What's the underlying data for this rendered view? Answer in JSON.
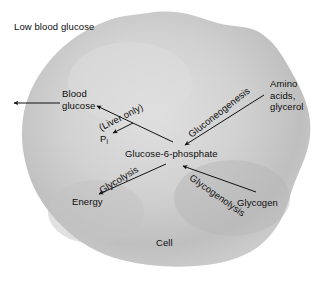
{
  "diagram": {
    "title": "Low blood glucose",
    "cell_label": "Cell",
    "colors": {
      "background": "#ffffff",
      "cell_fill_light": "#e8e8e8",
      "cell_fill_mid": "#c9c9c9",
      "cell_fill_dark": "#b0b0b0",
      "cell_edge": "#d8d8d8",
      "text": "#0d0d0d",
      "arrow": "#111111"
    },
    "labels": {
      "low_blood_glucose": "Low blood glucose",
      "blood_glucose_line1": "Blood",
      "blood_glucose_line2": "glucose",
      "liver_only": "(Liver only)",
      "pi_symbol": "P",
      "pi_subscript": "i",
      "glucose_6_phosphate": "Glucose-6-phosphate",
      "gluconeogenesis": "Gluconeogenesis",
      "amino_acids_line1": "Amino",
      "amino_acids_line2": "acids,",
      "amino_acids_line3": "glycerol",
      "glycolysis": "Glycolysis",
      "energy": "Energy",
      "glycogenolysis": "Glycogenolysis",
      "glycogen": "Glycogen",
      "cell": "Cell"
    },
    "pathways": [
      {
        "name": "gluconeogenesis",
        "label": "Gluconeogenesis",
        "from": "Amino acids, glycerol",
        "to": "Glucose-6-phosphate",
        "direction": "down-left"
      },
      {
        "name": "glycogenolysis",
        "label": "Glycogenolysis",
        "from": "Glycogen",
        "to": "Glucose-6-phosphate",
        "direction": "up-left"
      },
      {
        "name": "glycolysis",
        "label": "Glycolysis",
        "from": "Glucose-6-phosphate",
        "to": "Energy",
        "direction": "down-left"
      },
      {
        "name": "dephosphorylation",
        "label": "(Liver only)",
        "from": "Glucose-6-phosphate",
        "to": "Blood glucose",
        "direction": "up-left",
        "byproduct": "Pi"
      },
      {
        "name": "glucose-export",
        "label": "",
        "from": "Blood glucose",
        "to": "bloodstream",
        "direction": "left"
      }
    ]
  }
}
